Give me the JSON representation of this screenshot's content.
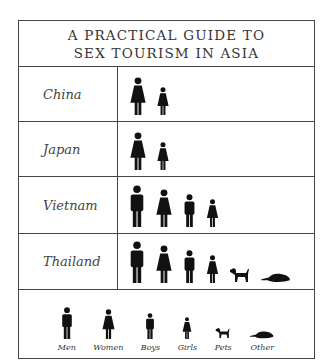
{
  "title": {
    "line1": "A PRACTICAL GUIDE TO",
    "line2": "SEX TOURISM IN ASIA"
  },
  "rows": [
    {
      "label": "China",
      "icons": [
        "woman-icon",
        "girl-icon"
      ]
    },
    {
      "label": "Japan",
      "icons": [
        "woman-icon",
        "girl-icon"
      ]
    },
    {
      "label": "Vietnam",
      "icons": [
        "man-icon",
        "woman-icon",
        "boy-icon",
        "girl-icon"
      ]
    },
    {
      "label": "Thailand",
      "icons": [
        "man-icon",
        "woman-icon",
        "boy-icon",
        "girl-icon",
        "dog-icon",
        "platypus-icon"
      ]
    }
  ],
  "legend": [
    {
      "icon": "man-icon",
      "label": "Men"
    },
    {
      "icon": "woman-icon",
      "label": "Women"
    },
    {
      "icon": "boy-icon",
      "label": "Boys"
    },
    {
      "icon": "girl-icon",
      "label": "Girls"
    },
    {
      "icon": "dog-icon",
      "label": "Pets"
    },
    {
      "icon": "platypus-icon",
      "label": "Other"
    }
  ],
  "colors": {
    "icon": "#111111",
    "border": "#444444",
    "text": "#333333"
  }
}
